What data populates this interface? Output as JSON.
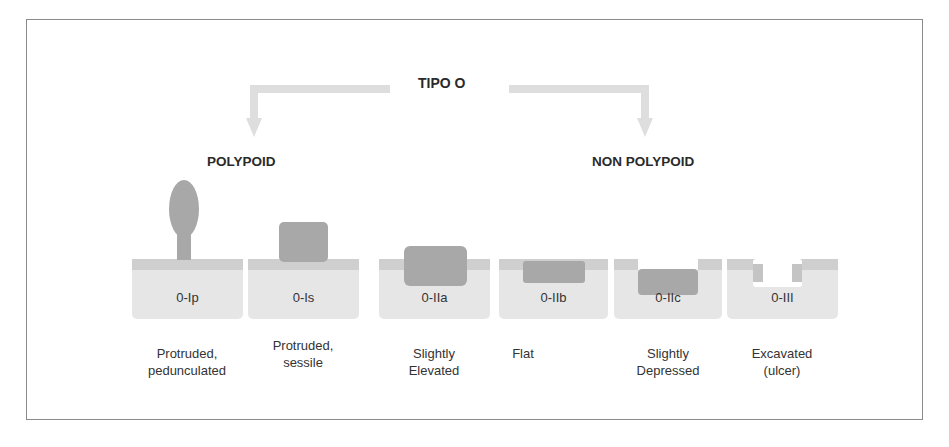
{
  "diagram": {
    "title": "TIPO O",
    "groups": [
      {
        "label": "POLYPOID"
      },
      {
        "label": "NON POLYPOID"
      }
    ],
    "types": [
      {
        "code": "0-Ip",
        "caption_line1": "Protruded,",
        "caption_line2": "pedunculated",
        "shape": "pedunculated"
      },
      {
        "code": "0-Is",
        "caption_line1": "Protruded,",
        "caption_line2": "sessile",
        "shape": "sessile"
      },
      {
        "code": "0-IIa",
        "caption_line1": "Slightly",
        "caption_line2": "Elevated",
        "shape": "elevated"
      },
      {
        "code": "0-IIb",
        "caption_line1": "Flat",
        "caption_line2": "",
        "shape": "flat"
      },
      {
        "code": "0-IIc",
        "caption_line1": "Slightly",
        "caption_line2": "Depressed",
        "shape": "depressed"
      },
      {
        "code": "0-III",
        "caption_line1": "Excavated",
        "caption_line2": "(ulcer)",
        "shape": "excavated"
      }
    ],
    "colors": {
      "frame": "#8a8a8a",
      "mucosa_band": "#cfcfcf",
      "submucosa": "#e6e6e6",
      "lesion": "#a8a8a8",
      "arrow": "#dedede",
      "text": "#2a2a2a"
    }
  }
}
